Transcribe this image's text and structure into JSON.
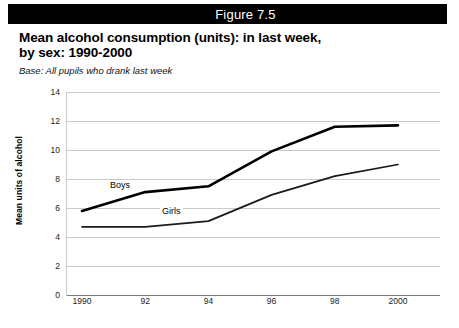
{
  "figure": {
    "bar_label": "Figure 7.5",
    "bar_color": "#000000",
    "bar_text_color": "#ffffff"
  },
  "title": {
    "line1": "Mean alcohol consumption (units): in last week,",
    "line2": "by sex: 1990-2000"
  },
  "base_note": "Base: All pupils who drank last week",
  "chart_data": {
    "type": "line",
    "title": "Mean alcohol consumption (units): in last week, by sex: 1990-2000",
    "subtitle": "Base: All pupils who drank last week",
    "xlabel": "",
    "ylabel": "Mean units of alcohol",
    "categories": [
      "1990",
      "92",
      "94",
      "96",
      "98",
      "2000"
    ],
    "x_tick_labels": [
      "1990",
      "92",
      "94",
      "96",
      "98",
      "2000"
    ],
    "y_tick_labels": [
      "0",
      "2",
      "4",
      "6",
      "8",
      "10",
      "12",
      "14"
    ],
    "y_ticks": [
      0,
      2,
      4,
      6,
      8,
      10,
      12,
      14
    ],
    "ylim": [
      0,
      14
    ],
    "grid": "horizontal",
    "legend": "inline-labels",
    "series": [
      {
        "name": "Boys",
        "values": [
          5.8,
          7.1,
          7.5,
          9.9,
          11.6,
          11.7
        ],
        "color": "#000000",
        "line_width": 2.6
      },
      {
        "name": "Girls",
        "values": [
          4.7,
          4.7,
          5.1,
          6.9,
          8.2,
          9.0
        ],
        "color": "#1a1a1a",
        "line_width": 1.7
      }
    ],
    "annotations": [
      {
        "text": "Boys",
        "series": "Boys"
      },
      {
        "text": "Girls",
        "series": "Girls"
      }
    ]
  }
}
